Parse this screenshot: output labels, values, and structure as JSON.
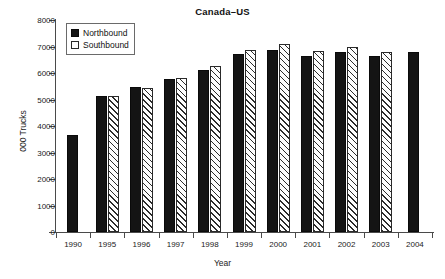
{
  "chart_data": {
    "type": "bar",
    "title": "Canada–US",
    "xlabel": "Year",
    "ylabel": "000 Trucks",
    "categories": [
      "1990",
      "1995",
      "1996",
      "1997",
      "1998",
      "1999",
      "2000",
      "2001",
      "2002",
      "2003",
      "2004"
    ],
    "series": [
      {
        "name": "Northbound",
        "values": [
          3650,
          5150,
          5460,
          5790,
          6100,
          6700,
          6870,
          6630,
          6780,
          6650,
          6790
        ],
        "color": "#141414",
        "fill": "solid"
      },
      {
        "name": "Southbound",
        "values": [
          null,
          5120,
          5420,
          5830,
          6280,
          6860,
          7090,
          6820,
          6970,
          6780,
          null
        ],
        "color": "#ffffff",
        "fill": "diagonal-hatch"
      }
    ],
    "ylim": [
      0,
      8000
    ],
    "yticks": [
      0,
      1000,
      2000,
      3000,
      4000,
      5000,
      6000,
      7000,
      8000
    ],
    "ytick_labels": [
      "0",
      "1000",
      "2000",
      "3000",
      "4000",
      "5000",
      "6000",
      "7000",
      "8000"
    ],
    "grid": false,
    "legend_position": "top-left-inside",
    "legend_entries": [
      "Northbound",
      "Southbound"
    ]
  }
}
